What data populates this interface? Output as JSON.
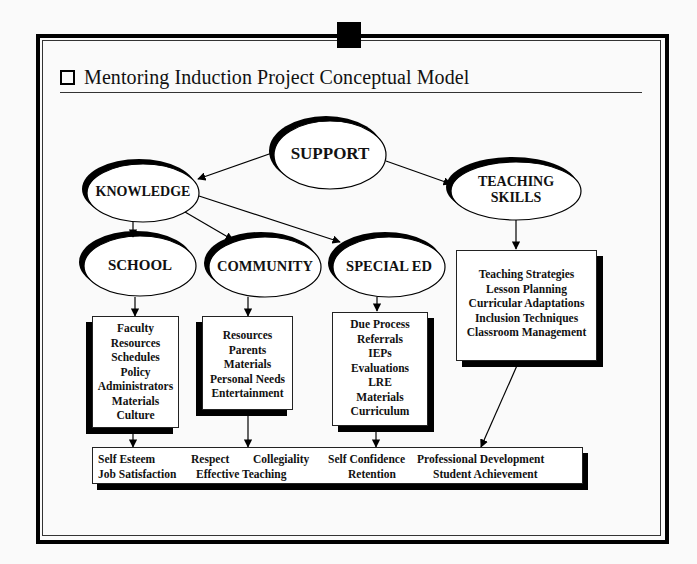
{
  "title": {
    "icon": "hollow-square-bullet",
    "text": "Mentoring Induction Project Conceptual Model"
  },
  "nodes": {
    "support": "SUPPORT",
    "knowledge": "KNOWLEDGE",
    "teaching_skills": [
      "TEACHING",
      "SKILLS"
    ],
    "school": "SCHOOL",
    "community": "COMMUNITY",
    "special_ed": "SPECIAL ED"
  },
  "boxes": {
    "school": [
      "Faculty",
      "Resources",
      "Schedules",
      "Policy",
      "Administrators",
      "Materials",
      "Culture"
    ],
    "community": [
      "Resources",
      "Parents",
      "Materials",
      "Personal Needs",
      "Entertainment"
    ],
    "special_ed": [
      "Due Process",
      "Referrals",
      "IEPs",
      "Evaluations",
      "LRE",
      "Materials",
      "Curriculum"
    ],
    "teaching_skills": [
      "Teaching Strategies",
      "Lesson Planning",
      "Curricular Adaptations",
      "Inclusion Techniques",
      "Classroom Management"
    ]
  },
  "outcomes": {
    "row1": [
      "Self Esteem",
      "Respect",
      "Collegiality",
      "Self Confidence",
      "Professional Development"
    ],
    "row2": [
      "Job Satisfaction",
      "Effective Teaching",
      "Retention",
      "Student Achievement"
    ]
  },
  "edges": [
    {
      "from": "SUPPORT",
      "to": "KNOWLEDGE"
    },
    {
      "from": "SUPPORT",
      "to": "TEACHING SKILLS"
    },
    {
      "from": "KNOWLEDGE",
      "to": "SCHOOL"
    },
    {
      "from": "KNOWLEDGE",
      "to": "COMMUNITY"
    },
    {
      "from": "KNOWLEDGE",
      "to": "SPECIAL ED"
    },
    {
      "from": "SCHOOL",
      "to": "school-list"
    },
    {
      "from": "COMMUNITY",
      "to": "community-list"
    },
    {
      "from": "SPECIAL ED",
      "to": "special-ed-list"
    },
    {
      "from": "TEACHING SKILLS",
      "to": "teaching-skills-list"
    },
    {
      "from": "school-list",
      "to": "outcomes"
    },
    {
      "from": "community-list",
      "to": "outcomes"
    },
    {
      "from": "special-ed-list",
      "to": "outcomes"
    },
    {
      "from": "teaching-skills-list",
      "to": "outcomes"
    }
  ]
}
